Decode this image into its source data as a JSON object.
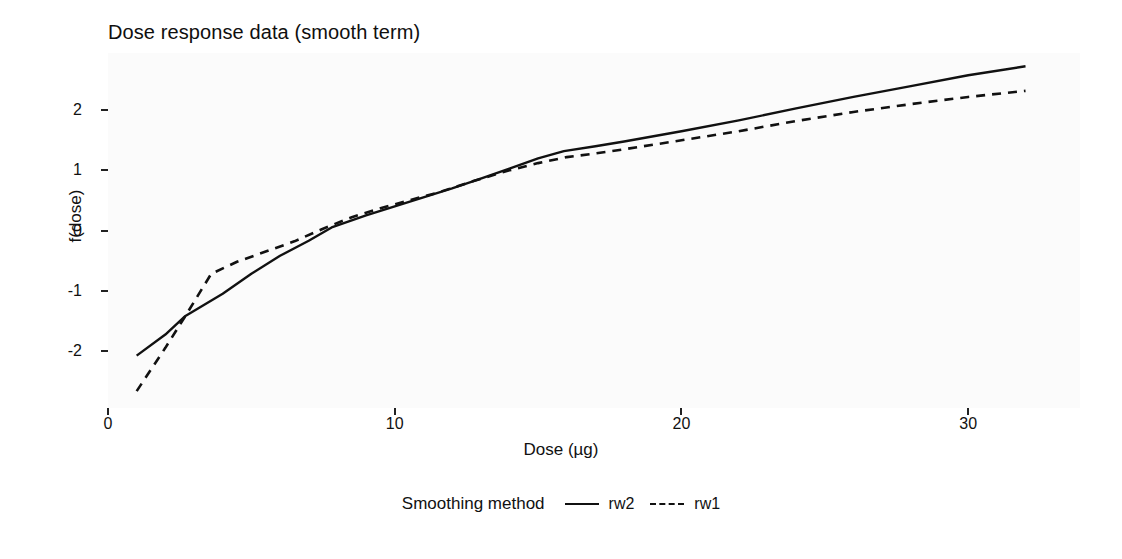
{
  "chart_data": {
    "type": "line",
    "title": "Dose response data (smooth term)",
    "xlabel": "Dose (µg)",
    "ylabel": "f(dose)",
    "xlim": [
      0.0,
      33.9
    ],
    "ylim": [
      -2.95,
      2.95
    ],
    "xticks": [
      0,
      10,
      20,
      30
    ],
    "xtick_labels": [
      "0",
      "10",
      "20",
      "30"
    ],
    "yticks": [
      -2,
      -1,
      0,
      1,
      2
    ],
    "ytick_labels": [
      "-2",
      "-1",
      "0",
      "1",
      "2"
    ],
    "grid": false,
    "legend_title": "Smoothing method",
    "legend_position": "bottom",
    "background": "#fbfbfb",
    "line_color": "#111111",
    "series": [
      {
        "name": "rw2",
        "style": "solid",
        "color": "#111111",
        "points": [
          [
            1.0,
            -2.08
          ],
          [
            2.0,
            -1.73
          ],
          [
            2.7,
            -1.42
          ],
          [
            4.0,
            -1.05
          ],
          [
            5.0,
            -0.72
          ],
          [
            6.0,
            -0.42
          ],
          [
            7.0,
            -0.17
          ],
          [
            7.8,
            0.05
          ],
          [
            9.0,
            0.25
          ],
          [
            10.0,
            0.4
          ],
          [
            11.0,
            0.55
          ],
          [
            12.0,
            0.7
          ],
          [
            12.8,
            0.83
          ],
          [
            14.0,
            1.03
          ],
          [
            15.0,
            1.2
          ],
          [
            15.9,
            1.32
          ],
          [
            17.0,
            1.4
          ],
          [
            18.0,
            1.48
          ],
          [
            20.0,
            1.65
          ],
          [
            22.0,
            1.83
          ],
          [
            24.0,
            2.03
          ],
          [
            26.0,
            2.22
          ],
          [
            28.0,
            2.4
          ],
          [
            30.0,
            2.58
          ],
          [
            32.0,
            2.73
          ]
        ]
      },
      {
        "name": "rw1",
        "style": "dashed",
        "color": "#111111",
        "points": [
          [
            1.0,
            -2.67
          ],
          [
            2.0,
            -1.95
          ],
          [
            2.7,
            -1.42
          ],
          [
            3.6,
            -0.72
          ],
          [
            4.5,
            -0.52
          ],
          [
            5.5,
            -0.35
          ],
          [
            6.5,
            -0.18
          ],
          [
            7.5,
            0.03
          ],
          [
            8.5,
            0.22
          ],
          [
            9.5,
            0.37
          ],
          [
            10.5,
            0.5
          ],
          [
            11.5,
            0.63
          ],
          [
            12.8,
            0.83
          ],
          [
            14.0,
            1.0
          ],
          [
            15.0,
            1.12
          ],
          [
            16.0,
            1.22
          ],
          [
            17.0,
            1.28
          ],
          [
            18.0,
            1.35
          ],
          [
            20.0,
            1.5
          ],
          [
            22.0,
            1.65
          ],
          [
            24.0,
            1.82
          ],
          [
            26.0,
            1.97
          ],
          [
            28.0,
            2.1
          ],
          [
            30.0,
            2.22
          ],
          [
            32.0,
            2.32
          ]
        ]
      }
    ]
  }
}
